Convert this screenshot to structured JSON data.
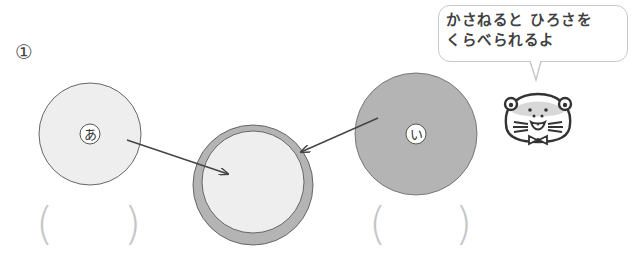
{
  "question_number": "①",
  "bubble": {
    "line1": "かさねると ひろさを",
    "line2": "くらべられるよ"
  },
  "circles": [
    {
      "id": "a",
      "label": "あ",
      "fill": "#eeeeee"
    },
    {
      "id": "i",
      "label": "い",
      "fill": "#b4b4b4"
    },
    {
      "id": "overlap",
      "outer_fill": "#b4b4b4",
      "inner_fill": "#eeeeee"
    }
  ],
  "answers": [
    {
      "open": "(",
      "close": ")",
      "value": ""
    },
    {
      "open": "(",
      "close": ")",
      "value": ""
    }
  ],
  "colors": {
    "stroke": "#555555",
    "light_fill": "#eeeeee",
    "dark_fill": "#b4b4b4",
    "paren": "#c4c4c4"
  }
}
